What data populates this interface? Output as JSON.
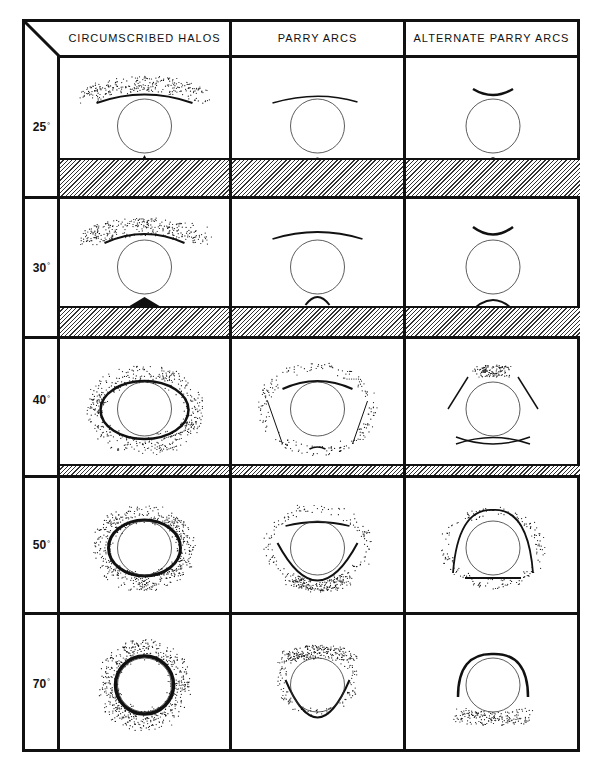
{
  "figure": {
    "columns": [
      {
        "id": "circumscribed",
        "label": "CIRCUMSCRIBED  HALOS"
      },
      {
        "id": "parry",
        "label": "PARRY  ARCS"
      },
      {
        "id": "alt_parry",
        "label": "ALTERNATE PARRY ARCS"
      }
    ],
    "rows": [
      {
        "id": "r25",
        "angle": "25",
        "unit": "°",
        "horizon": true,
        "horizon_height": 36
      },
      {
        "id": "r30",
        "angle": "30",
        "unit": "°",
        "horizon": true,
        "horizon_height": 28
      },
      {
        "id": "r40",
        "angle": "40",
        "unit": "°",
        "horizon": true,
        "horizon_height": 9
      },
      {
        "id": "r50",
        "angle": "50",
        "unit": "°",
        "horizon": false,
        "horizon_height": 0
      },
      {
        "id": "r70",
        "angle": "70",
        "unit": "°",
        "horizon": false,
        "horizon_height": 0
      }
    ],
    "colors": {
      "ink": "#111111",
      "background": "#ffffff"
    }
  }
}
